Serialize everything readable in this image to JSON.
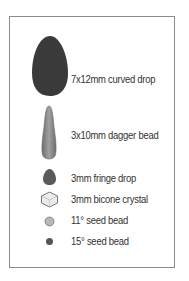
{
  "legend": {
    "items": [
      {
        "shape": "curved-drop",
        "label": "7x12mm curved drop",
        "color": "#3a3a3a"
      },
      {
        "shape": "dagger-bead",
        "label": "3x10mm dagger bead",
        "color": "#8a8a8a"
      },
      {
        "shape": "fringe-drop",
        "label": "3mm fringe drop",
        "color": "#5a5a5a"
      },
      {
        "shape": "bicone-crystal",
        "label": "3mm bicone crystal",
        "color": "#e6e6e6"
      },
      {
        "shape": "seed-bead-11",
        "label": "11° seed bead",
        "color": "#b5b5b5"
      },
      {
        "shape": "seed-bead-15",
        "label": "15° seed bead",
        "color": "#555555"
      }
    ]
  }
}
